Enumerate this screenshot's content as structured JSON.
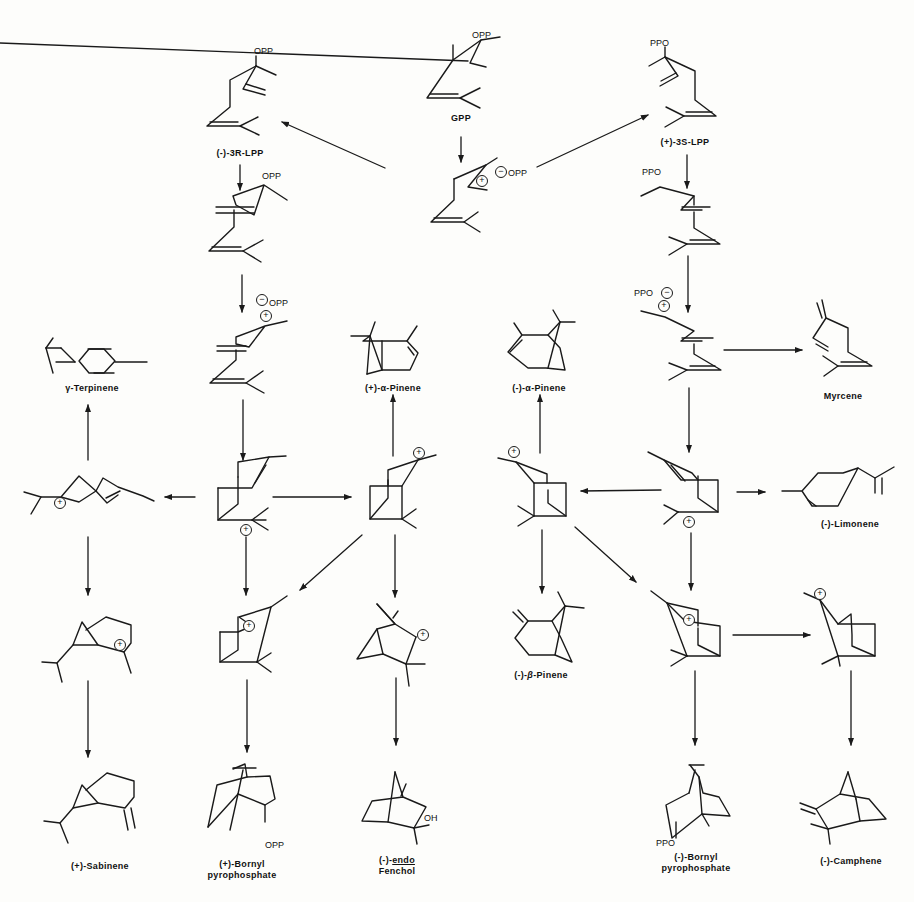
{
  "figure": {
    "compounds": {
      "gpp": {
        "label": "GPP",
        "group": "OPP"
      },
      "lpp_r": {
        "label": "(-)-3R-LPP",
        "group": "OPP"
      },
      "lpp_s": {
        "label": "(+)-3S-LPP",
        "group": "PPO"
      },
      "ion_pair": {
        "anion": "OPP",
        "charge": "+"
      },
      "r_rotamer": {
        "group": "OPP"
      },
      "s_rotamer": {
        "group": "PPO"
      },
      "r_ion_pair": {
        "anion": "OPP"
      },
      "s_ion_pair": {
        "anion": "PPO"
      },
      "gamma_terpinene": {
        "label_prefix": "γ",
        "label_suffix": "-Terpinene"
      },
      "plus_alpha_pinene": {
        "label": "(+)-α-Pinene"
      },
      "minus_alpha_pinene": {
        "label": "(-)-α-Pinene"
      },
      "myrcene": {
        "label": "Myrcene"
      },
      "minus_limonene": {
        "label": "(-)-Limonene"
      },
      "minus_beta_pinene": {
        "label_prefix": "(-)-",
        "label_italic": "β",
        "label_suffix": "-Pinene"
      },
      "plus_sabinene": {
        "label": "(+)-Sabinene"
      },
      "plus_bornyl_pp": {
        "line1": "(+)-Bornyl",
        "line2": "pyrophosphate",
        "group": "OPP"
      },
      "endo_fenchol": {
        "prefix": "(-)-",
        "underlined": "endo",
        "line2": "Fenchol",
        "group": "OH"
      },
      "minus_bornyl_pp": {
        "line1": "(-)-Bornyl",
        "line2": "pyrophosphate",
        "group": "PPO"
      },
      "minus_camphene": {
        "label": "(-)-Camphene"
      }
    },
    "charges": {
      "cation": "+",
      "anion": "−"
    }
  }
}
